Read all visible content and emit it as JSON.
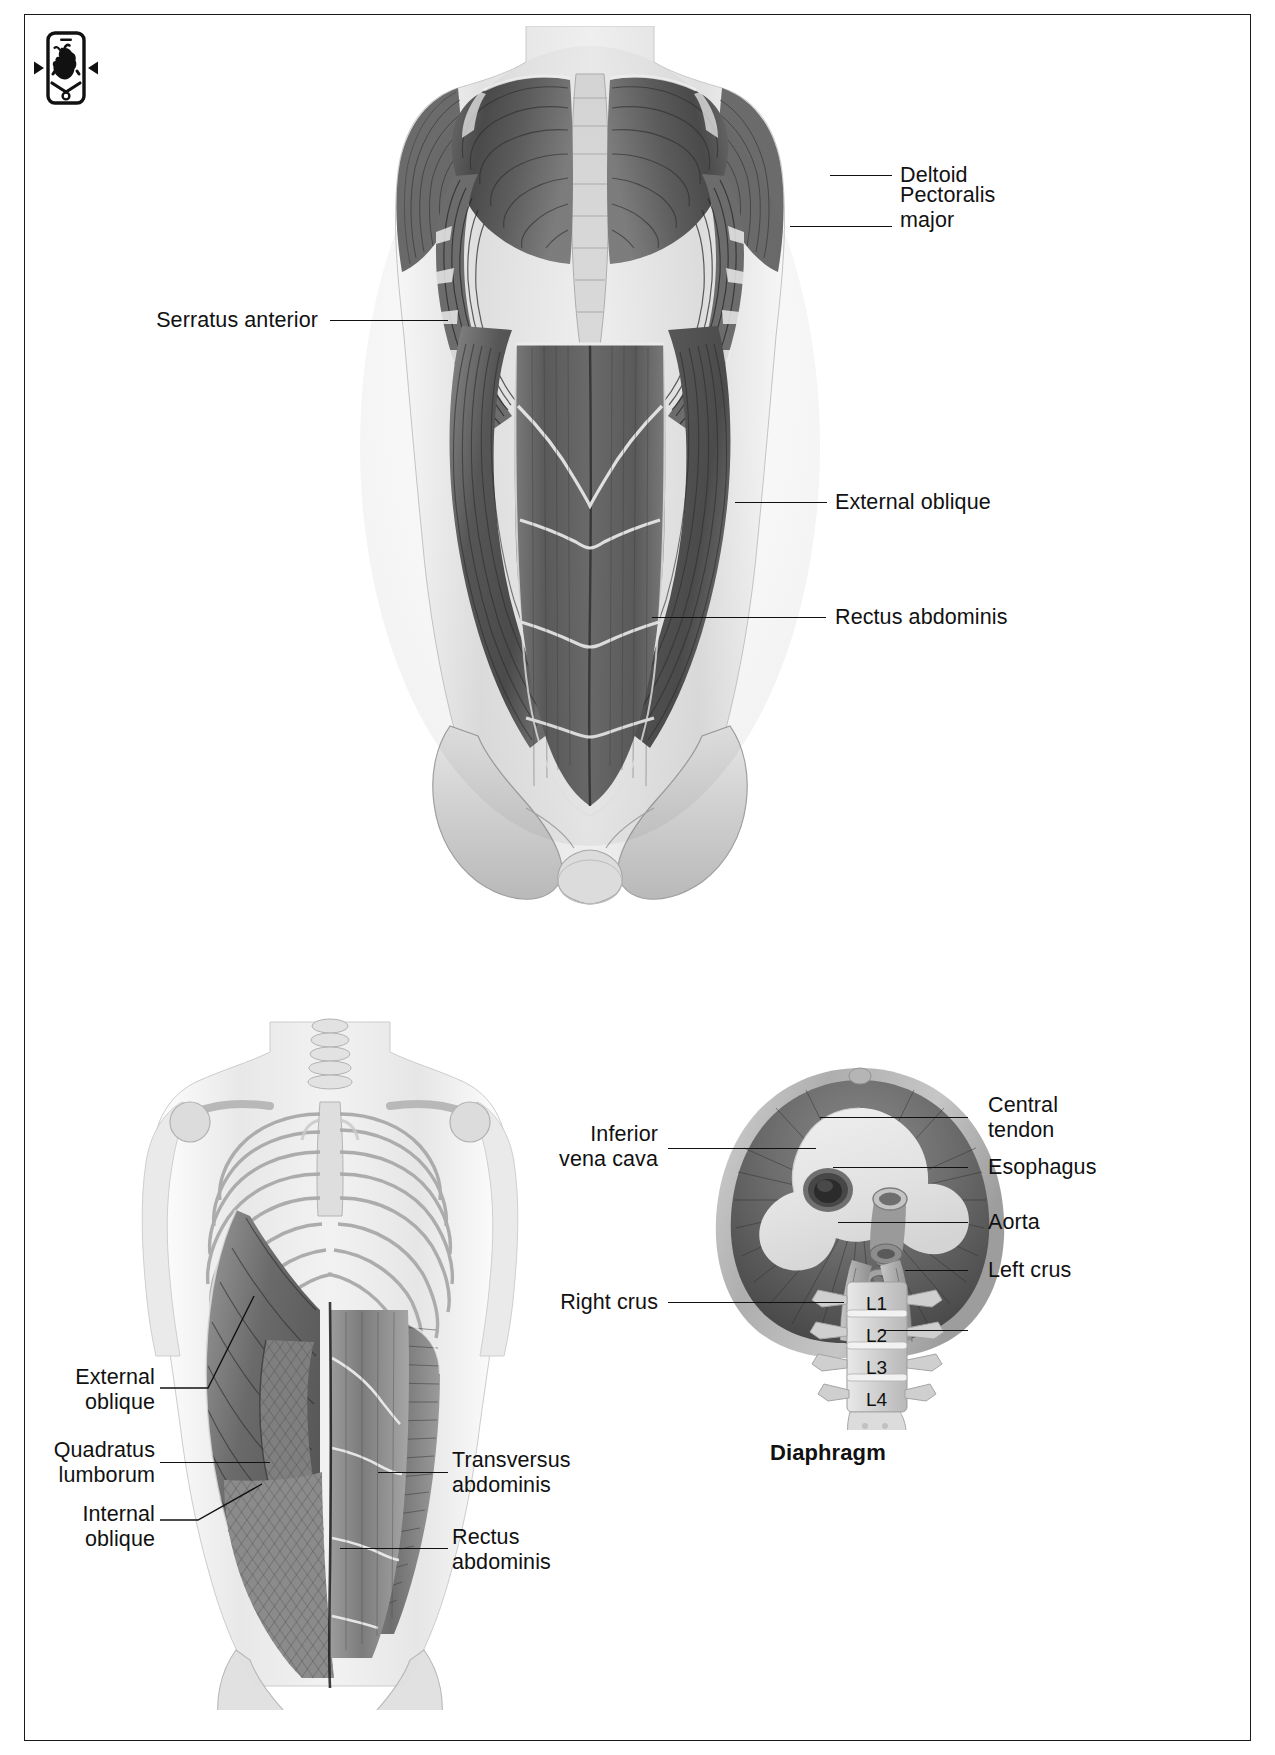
{
  "page": {
    "background": "#ffffff",
    "border_color": "#1a1a1a",
    "text_color": "#111111"
  },
  "app_icon": {
    "name": "phone-heart-icon",
    "description": "smartphone with anatomical heart, left and right arrow triangles"
  },
  "figures": [
    {
      "id": "anterior-trunk",
      "caption": "",
      "labels": [
        {
          "text": "Deltoid",
          "side": "right"
        },
        {
          "text": "Pectoralis\nmajor",
          "side": "right"
        },
        {
          "text": "Serratus anterior",
          "side": "left"
        },
        {
          "text": "External oblique",
          "side": "right"
        },
        {
          "text": "Rectus abdominis",
          "side": "right"
        }
      ]
    },
    {
      "id": "deep-trunk",
      "caption": "",
      "labels": [
        {
          "text": "External\noblique",
          "side": "left"
        },
        {
          "text": "Quadratus\nlumborum",
          "side": "left"
        },
        {
          "text": "Internal\noblique",
          "side": "left"
        },
        {
          "text": "Transversus\nabdominis",
          "side": "right"
        },
        {
          "text": "Rectus\nabdominis",
          "side": "right"
        }
      ]
    },
    {
      "id": "diaphragm",
      "caption": "Diaphragm",
      "labels": [
        {
          "text": "Central\ntendon",
          "side": "right"
        },
        {
          "text": "Esophagus",
          "side": "right"
        },
        {
          "text": "Aorta",
          "side": "right"
        },
        {
          "text": "Left crus",
          "side": "right"
        },
        {
          "text": "Inferior\nvena cava",
          "side": "left"
        },
        {
          "text": "Right crus",
          "side": "left"
        }
      ],
      "vertebrae": [
        "L1",
        "L2",
        "L3",
        "L4"
      ]
    }
  ],
  "labels": {
    "deltoid": "Deltoid",
    "pectoralis_major_l1": "Pectoralis",
    "pectoralis_major_l2": "major",
    "serratus_anterior": "Serratus anterior",
    "external_oblique": "External oblique",
    "rectus_abdominis": "Rectus abdominis",
    "external_oblique_l1": "External",
    "external_oblique_l2": "oblique",
    "quadratus_lumborum_l1": "Quadratus",
    "quadratus_lumborum_l2": "lumborum",
    "internal_oblique_l1": "Internal",
    "internal_oblique_l2": "oblique",
    "transversus_abdominis_l1": "Transversus",
    "transversus_abdominis_l2": "abdominis",
    "rectus_abdominis_l1": "Rectus",
    "rectus_abdominis_l2": "abdominis",
    "central_tendon_l1": "Central",
    "central_tendon_l2": "tendon",
    "esophagus": "Esophagus",
    "aorta": "Aorta",
    "left_crus": "Left crus",
    "inferior_vena_cava_l1": "Inferior",
    "inferior_vena_cava_l2": "vena cava",
    "right_crus": "Right crus",
    "vertebra_l1": "L1",
    "vertebra_l2": "L2",
    "vertebra_l3": "L3",
    "vertebra_l4": "L4",
    "diaphragm_caption": "Diaphragm"
  }
}
